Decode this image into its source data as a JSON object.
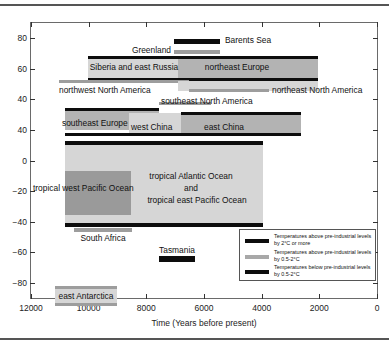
{
  "chart_data": {
    "type": "bar",
    "title": "",
    "xlabel": "Time (Years before present)",
    "ylabel": "Latitude (degrees)",
    "xlim": [
      12000,
      0
    ],
    "ylim": [
      -90,
      90
    ],
    "xticks": [
      "12000",
      "10000",
      "8000",
      "6000",
      "4000",
      "2000",
      "0"
    ],
    "xtick_values": [
      12000,
      10000,
      8000,
      6000,
      4000,
      2000,
      0
    ],
    "yticks": [
      "80",
      "60",
      "40",
      "40",
      "0",
      "−20",
      "−40",
      "−60",
      "−80"
    ],
    "ytick_values": [
      80,
      60,
      40,
      20,
      0,
      -20,
      -40,
      -60,
      -80
    ],
    "grid": false,
    "legend_position": "inside lower right",
    "regions": [
      {
        "name": "Barents Sea",
        "x_start": 6700,
        "x_end": 5200,
        "lat": 76,
        "warmth": "above-2C"
      },
      {
        "name": "Greenland",
        "x_start": 6700,
        "x_end": 5200,
        "lat": 72,
        "warmth": "above-0.5-2C"
      },
      {
        "name": "Siberia and east Russia",
        "x_start": 9000,
        "x_end": 6200,
        "lat": 63,
        "warmth": "above-2C"
      },
      {
        "name": "northeast Europe",
        "x_start": 6200,
        "x_end": 2300,
        "lat": 63,
        "warmth": "above-2C"
      },
      {
        "name": "northwest North America",
        "x_start": 11000,
        "x_end": 6100,
        "lat": 59,
        "warmth": "above-0.5-2C"
      },
      {
        "name": "northeast North America",
        "x_start": 6100,
        "x_end": 3400,
        "lat": 54,
        "warmth": "above-0.5-2C"
      },
      {
        "name": "southeast North America",
        "x_start": 6700,
        "x_end": 4200,
        "lat": 45,
        "warmth": "above-0.5-2C"
      },
      {
        "name": "southeast Europe",
        "x_start": 9500,
        "x_end": 6700,
        "lat": 38,
        "warmth": "above-0.5-2C"
      },
      {
        "name": "west China",
        "x_start": 8000,
        "x_end": 6800,
        "lat": 36,
        "warmth": "above-0.5-2C"
      },
      {
        "name": "east China",
        "x_start": 6800,
        "x_end": 3000,
        "lat": 36,
        "warmth": "above-2C"
      },
      {
        "name": "tropical west Pacific Ocean",
        "x_start": 9400,
        "x_end": 6700,
        "lat": 2,
        "warmth": "above-0.5-2C"
      },
      {
        "name": "tropical Atlantic Ocean and tropical east Pacific Ocean",
        "x_start": 9500,
        "x_end": 3000,
        "lat": 10,
        "warmth": "above-2C"
      },
      {
        "name": "South Africa",
        "x_start": 9100,
        "x_end": 7400,
        "lat": -26,
        "warmth": "above-0.5-2C"
      },
      {
        "name": "Tasmania",
        "x_start": 6400,
        "x_end": 5200,
        "lat": -42,
        "warmth": "below-0.5-2C"
      },
      {
        "name": "east Antarctica",
        "x_start": 11000,
        "x_end": 9000,
        "lat": -72,
        "warmth": "above-0.5-2C"
      }
    ],
    "legend": [
      {
        "key": "above-2C",
        "label": "Temperatures above pre-industrial levels by 2°C or more",
        "color": "#0d0d0d"
      },
      {
        "key": "above-0.5-2C",
        "label": "Temperatures above pre-industrial levels by 0.5-2°C",
        "color": "#a8a8a8"
      },
      {
        "key": "below-0.5-2C",
        "label": "Temperatures below pre-industrial levels by 0.5-2°C",
        "color": "#0d0d0d"
      }
    ]
  },
  "axes": {
    "y_title": "Latitude (degrees)",
    "x_title": "Time (Years before present)",
    "y_labels": [
      "80",
      "60",
      "40",
      "40",
      "0",
      "−20",
      "−40",
      "−60",
      "−80"
    ],
    "x_labels": [
      "12000",
      "10000",
      "8000",
      "6000",
      "4000",
      "2000",
      "0"
    ]
  },
  "labels": {
    "barents_sea": "Barents Sea",
    "greenland": "Greenland",
    "siberia": "Siberia and east Russia",
    "northeast_europe": "northeast Europe",
    "northwest_north_america": "northwest North America",
    "northeast_north_america": "northeast North America",
    "southeast_north_america": "southeast North America",
    "southeast_europe": "southeast Europe",
    "west_china": "west China",
    "east_china": "east China",
    "tropical_west_pacific": "tropical west Pacific Ocean",
    "tropical_atlantic_1": "tropical Atlantic Ocean",
    "tropical_atlantic_2": "and",
    "tropical_atlantic_3": "tropical east Pacific Ocean",
    "south_africa": "South Africa",
    "tasmania": "Tasmania",
    "east_antarctica": "east Antarctica"
  },
  "legend": {
    "item1": "Temperatures above pre-industrial levels by 2°C or more",
    "item2": "Temperatures above pre-industrial levels by 0.5-2°C",
    "item3": "Temperatures below pre-industrial levels by 0.5-2°C"
  }
}
